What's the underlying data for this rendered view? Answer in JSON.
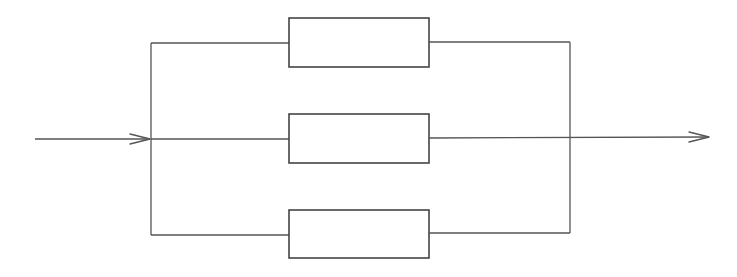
{
  "diagram": {
    "type": "parallel-system-block-diagram",
    "colors": {
      "line": "#555555",
      "block_border": "#444444",
      "background": "#ffffff"
    },
    "input": {
      "x1": 35,
      "x2": 150,
      "y": 139
    },
    "output": {
      "x1": 429,
      "x2": 709,
      "y": 137
    },
    "left_bus": {
      "x": 151,
      "y1": 43,
      "y2": 235
    },
    "right_bus": {
      "x": 570,
      "y1": 42,
      "y2": 233
    },
    "blocks": [
      {
        "id": "block-1",
        "label": "",
        "x": 289,
        "y": 18,
        "width": 140,
        "height": 49,
        "branch_y": 43
      },
      {
        "id": "block-2",
        "label": "",
        "x": 289,
        "y": 114,
        "width": 140,
        "height": 49,
        "branch_y": 139
      },
      {
        "id": "block-3",
        "label": "",
        "x": 289,
        "y": 210,
        "width": 140,
        "height": 48,
        "branch_y": 234
      }
    ]
  }
}
